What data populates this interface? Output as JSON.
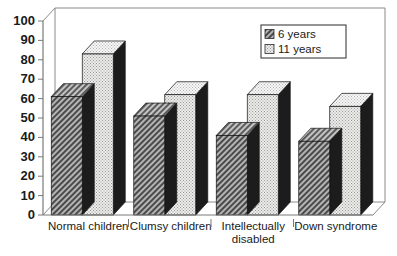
{
  "chart_data": {
    "type": "bar",
    "title": "",
    "subtitle": "",
    "xlabel": "",
    "ylabel": "",
    "ylim": [
      0,
      100
    ],
    "ytick_step": 10,
    "yticks": [
      "0",
      "10",
      "20",
      "30",
      "40",
      "50",
      "60",
      "70",
      "80",
      "90",
      "100"
    ],
    "grid": false,
    "legend_position": "top-right",
    "style": "3d-bar",
    "categories": [
      "Normal children",
      "Clumsy children",
      "Intellectually disabled",
      "Down syndrome"
    ],
    "category_lines": [
      [
        "Normal children"
      ],
      [
        "Clumsy children"
      ],
      [
        "Intellectually",
        "disabled"
      ],
      [
        "Down syndrome"
      ]
    ],
    "series": [
      {
        "name": "6 years",
        "values": [
          61,
          51,
          41,
          38
        ],
        "fill": "hatch-dark",
        "color": "#8c8c8c"
      },
      {
        "name": "11 years",
        "values": [
          83,
          62,
          62,
          56
        ],
        "fill": "dot-light",
        "color": "#e3e3e3"
      }
    ]
  },
  "legend": {
    "entries": [
      {
        "label": "6 years",
        "swatch": "hatch-dark"
      },
      {
        "label": "11 years",
        "swatch": "dot-light"
      }
    ]
  },
  "axes": {
    "y": {
      "min": "0",
      "max": "100",
      "labels": [
        "100",
        "90",
        "80",
        "70",
        "60",
        "50",
        "40",
        "30",
        "20",
        "10",
        "0"
      ]
    },
    "x": {
      "labels": [
        "Normal children",
        "Clumsy children",
        "Intellectually",
        "disabled",
        "Down syndrome"
      ]
    }
  },
  "colors": {
    "axis": "#7a7a7a",
    "frame": "#8a8a8a",
    "text": "#1a1a1a",
    "bar_dark_face": "#8e8e8e",
    "bar_dark_side": "#1c1c1c",
    "bar_dark_top": "#9d9d9d",
    "bar_light_face": "#e0e0e0",
    "bar_light_side": "#1c1c1c",
    "bar_light_top": "#f2f2f2",
    "background": "#ffffff"
  }
}
